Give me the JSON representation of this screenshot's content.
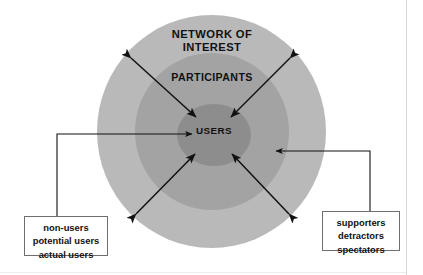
{
  "diagram": {
    "title_present": false,
    "rings": [
      {
        "id": "outer",
        "label": "NETWORK OF\nINTEREST",
        "color": "#b9b9b9"
      },
      {
        "id": "middle",
        "label": "PARTICIPANTS",
        "color": "#a3a3a3"
      },
      {
        "id": "inner",
        "label": "USERS",
        "color": "#8d8d8d"
      }
    ],
    "callouts": {
      "left": {
        "lines": [
          "non-users",
          "potential users",
          "actual users"
        ],
        "line1": "non-users",
        "line2": "potential users",
        "line3": "actual users"
      },
      "right": {
        "lines": [
          "supporters",
          "detractors",
          "spectators"
        ],
        "line1": "supporters",
        "line2": "detractors",
        "line3": "spectators"
      }
    },
    "arrows": {
      "count": 6,
      "diagonal_double_headed": 4,
      "callout_connectors": 2,
      "color": "#111111"
    },
    "colors": {
      "ring_outer": "#b9b9b9",
      "ring_middle": "#a3a3a3",
      "ring_inner": "#8d8d8d",
      "text": "#111111",
      "callout_border": "#6e6e6e",
      "background": "#ffffff"
    }
  }
}
